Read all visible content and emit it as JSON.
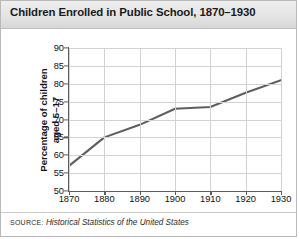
{
  "figure": {
    "title": "Children Enrolled in Public School, 1870–1930",
    "source_label": "SOURCE:",
    "source_text": "Historical Statistics of the United States",
    "border_color": "#b9b9b9",
    "header_bg": "#e4e4e4",
    "line_color": "#5e5e5e",
    "grid_color": "#d2d2d2",
    "axis_color": "#5c5c5c"
  },
  "chart_data": {
    "type": "line",
    "title": "Children Enrolled in Public School, 1870–1930",
    "xlabel": "",
    "ylabel": "Percentage of children aged 5–17",
    "ylabel_line1": "Percentage of children",
    "ylabel_line2": "aged 5–17",
    "x": [
      1870,
      1880,
      1890,
      1900,
      1910,
      1920,
      1930
    ],
    "values": [
      57,
      65,
      68.5,
      73,
      73.5,
      77.5,
      81
    ],
    "xticks": [
      "1870",
      "1880",
      "1890",
      "1900",
      "1910",
      "1920",
      "1930"
    ],
    "yticks": [
      "50",
      "55",
      "60",
      "65",
      "70",
      "75",
      "80",
      "85",
      "90"
    ],
    "ytick_values": [
      50,
      55,
      60,
      65,
      70,
      75,
      80,
      85,
      90
    ],
    "xlim": [
      1870,
      1930
    ],
    "ylim": [
      50,
      90
    ],
    "grid": true,
    "legend": "none",
    "series_name": "Percentage of children aged 5–17 enrolled"
  }
}
